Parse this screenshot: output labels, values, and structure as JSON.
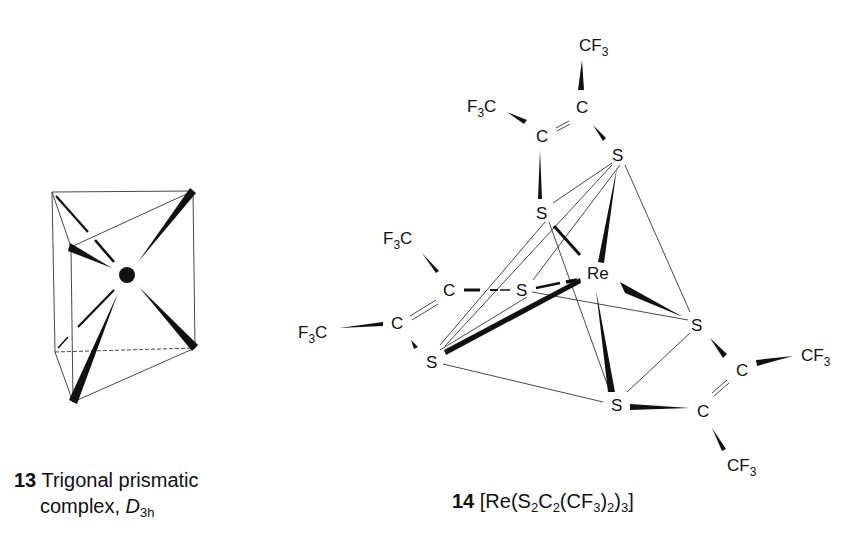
{
  "figure_13": {
    "number": "13",
    "caption_line1": "Trigonal prismatic",
    "caption_line2": "complex,",
    "symmetry_symbol": "D",
    "symmetry_subscript": "3h",
    "structure": "trigonal prism with central metal atom bonded to 6 vertices"
  },
  "figure_14": {
    "number": "14",
    "formula_parts": [
      "[Re(S",
      "2",
      "C",
      "2",
      "(CF",
      "3",
      ")",
      "2",
      ")",
      "3",
      "]"
    ],
    "atoms": {
      "center": "Re",
      "sulfur": "S",
      "carbon": "C",
      "cf3": "CF",
      "cf3_sub": "3",
      "f3c_F": "F",
      "f3c_sub": "3",
      "f3c_C": "C"
    }
  }
}
